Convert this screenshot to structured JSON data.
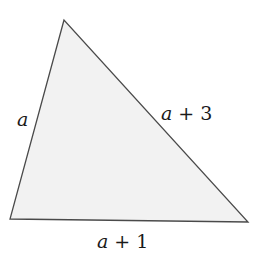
{
  "diagram": {
    "shape": "triangle",
    "fill_color": "#f2f2f2",
    "stroke_color": "#4a4a4a",
    "vertices": {
      "top": [
        64,
        20
      ],
      "bottom_left": [
        10,
        219
      ],
      "bottom_right": [
        248,
        222
      ]
    },
    "sides": {
      "left": {
        "variable": "a",
        "suffix": ""
      },
      "right": {
        "variable": "a",
        "suffix": " + 3"
      },
      "bottom": {
        "variable": "a",
        "suffix": " + 1"
      }
    }
  }
}
